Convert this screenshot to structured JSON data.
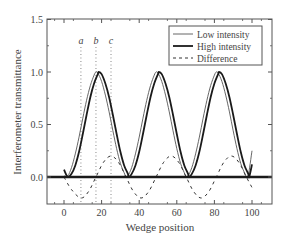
{
  "chart_data": {
    "type": "line",
    "title": "",
    "xlabel": "Wedge position",
    "ylabel": "Interferometer transmittance",
    "xlim": [
      -9,
      110
    ],
    "ylim": [
      -0.26,
      1.5
    ],
    "xticks": [
      0,
      20,
      40,
      60,
      80,
      100
    ],
    "xtick_labels": [
      "0",
      "20",
      "40",
      "60",
      "80",
      "100"
    ],
    "yticks": [
      0.0,
      0.5,
      1.0,
      1.5
    ],
    "ytick_labels": [
      "0.0",
      "0.5",
      "1.0",
      "1.5"
    ],
    "grid": false,
    "legend_position": "upper right",
    "series": [
      {
        "name": "Low intensity",
        "style": "thin-solid",
        "x": [
          0,
          2,
          4,
          6,
          8,
          10,
          12,
          14,
          16,
          17,
          18,
          20,
          22,
          24,
          26,
          28,
          30,
          32,
          33,
          34,
          36,
          38,
          40,
          42,
          44,
          46,
          48,
          49,
          50,
          52,
          54,
          56,
          58,
          60,
          62,
          64,
          65,
          66,
          68,
          70,
          72,
          74,
          76,
          78,
          80,
          81,
          82,
          84,
          86,
          88,
          90,
          92,
          94,
          96,
          97,
          98,
          100
        ],
        "values": [
          0.01,
          0.01,
          0.09,
          0.22,
          0.38,
          0.56,
          0.73,
          0.87,
          0.97,
          1.0,
          0.99,
          0.91,
          0.78,
          0.62,
          0.44,
          0.27,
          0.13,
          0.04,
          0.0,
          0.01,
          0.09,
          0.22,
          0.38,
          0.56,
          0.73,
          0.87,
          0.97,
          1.0,
          0.99,
          0.91,
          0.78,
          0.62,
          0.44,
          0.27,
          0.13,
          0.04,
          0.0,
          0.01,
          0.09,
          0.22,
          0.38,
          0.56,
          0.73,
          0.87,
          0.97,
          1.0,
          0.99,
          0.91,
          0.78,
          0.62,
          0.44,
          0.27,
          0.13,
          0.04,
          0.0,
          0.01,
          0.25
        ]
      },
      {
        "name": "High intensity",
        "style": "thick-solid",
        "x": [
          0,
          2,
          4,
          6,
          8,
          10,
          12,
          14,
          16,
          18,
          18.5,
          20,
          22,
          24,
          26,
          28,
          30,
          32,
          34,
          34.5,
          36,
          38,
          40,
          42,
          44,
          46,
          48,
          50,
          50.5,
          52,
          54,
          56,
          58,
          60,
          62,
          64,
          66,
          66.5,
          68,
          70,
          72,
          74,
          76,
          78,
          80,
          82,
          82.5,
          84,
          86,
          88,
          90,
          92,
          94,
          96,
          98,
          98.5,
          100
        ],
        "values": [
          0.07,
          0.0,
          0.03,
          0.11,
          0.24,
          0.41,
          0.59,
          0.76,
          0.89,
          0.98,
          1.0,
          0.98,
          0.89,
          0.76,
          0.59,
          0.41,
          0.24,
          0.11,
          0.03,
          0.0,
          0.03,
          0.11,
          0.24,
          0.41,
          0.59,
          0.76,
          0.89,
          0.98,
          1.0,
          0.98,
          0.89,
          0.76,
          0.59,
          0.41,
          0.24,
          0.11,
          0.03,
          0.0,
          0.03,
          0.11,
          0.24,
          0.41,
          0.59,
          0.76,
          0.89,
          0.98,
          1.0,
          0.98,
          0.89,
          0.76,
          0.59,
          0.41,
          0.24,
          0.11,
          0.03,
          0.0,
          0.12
        ]
      },
      {
        "name": "Difference",
        "style": "dashed",
        "x": [
          0,
          4,
          9,
          13,
          17,
          21,
          25,
          29,
          33,
          37,
          41,
          45,
          49,
          53,
          57,
          61,
          65,
          69,
          73,
          77,
          81,
          85,
          89,
          93,
          97,
          100
        ],
        "values": [
          0.0,
          -0.12,
          -0.2,
          -0.14,
          0.0,
          0.14,
          0.2,
          0.14,
          0.0,
          -0.14,
          -0.2,
          -0.14,
          0.0,
          0.14,
          0.2,
          0.14,
          0.0,
          -0.14,
          -0.2,
          -0.14,
          0.0,
          0.14,
          0.2,
          0.14,
          0.0,
          -0.1
        ]
      }
    ],
    "reference_lines": [
      {
        "label": "a",
        "x": 9,
        "style": "dotted-vertical"
      },
      {
        "label": "b",
        "x": 17,
        "style": "dotted-vertical"
      },
      {
        "label": "c",
        "x": 25,
        "style": "dotted-vertical"
      }
    ],
    "baseline": {
      "y": 0.0,
      "style": "thick-horizontal"
    }
  },
  "legend": {
    "items": [
      {
        "label": "Low intensity",
        "style": "thin-solid"
      },
      {
        "label": "High intensity",
        "style": "thick-solid"
      },
      {
        "label": "Difference",
        "style": "dashed"
      }
    ]
  },
  "colors": {
    "axis": "#555555",
    "low": "#555555",
    "high": "#1a1a1a",
    "difference": "#333333",
    "reference": "#888888",
    "text": "#444444"
  }
}
